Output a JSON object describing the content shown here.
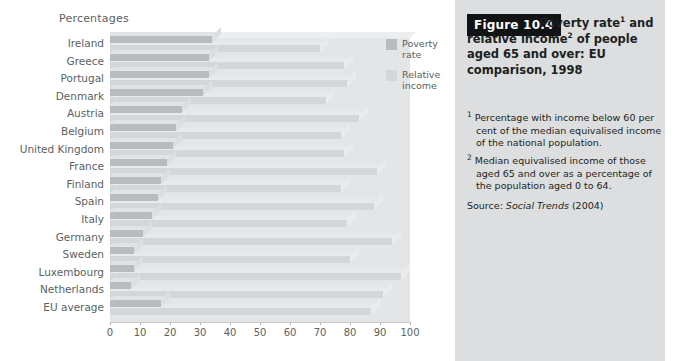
{
  "axis": {
    "y_axis_title": "Percentages",
    "ticks": [
      "0",
      "10",
      "20",
      "30",
      "40",
      "50",
      "60",
      "70",
      "80",
      "90",
      "100"
    ]
  },
  "legend": {
    "items": [
      {
        "label": "Poverty rate",
        "color": "#b9bcbf",
        "name": "poverty-rate"
      },
      {
        "label": "Relative income",
        "color": "#d4d7d9",
        "name": "relative-income"
      }
    ]
  },
  "caption": {
    "figure_tag": "Figure 10.4",
    "title": "Poverty rate¹ and relative income² of people aged 65 and over: EU comparison, 1998",
    "footnote_1": "¹ Percentage with income below 60 per cent of the median equivalised income of the national population.",
    "footnote_2": "² Median equivalised income of those aged 65 and over as a percentage of the population aged 0 to 64.",
    "source_prefix": "Source: ",
    "source_title": "Social Trends",
    "source_year": " (2004)"
  },
  "chart_data": {
    "type": "bar",
    "orientation": "horizontal",
    "xlabel": "Percentages",
    "ylabel": "",
    "xlim": [
      0,
      100
    ],
    "xticks": [
      0,
      10,
      20,
      30,
      40,
      50,
      60,
      70,
      80,
      90,
      100
    ],
    "grid": false,
    "legend_position": "right",
    "categories": [
      "Ireland",
      "Greece",
      "Portugal",
      "Denmark",
      "Austria",
      "Belgium",
      "United Kingdom",
      "France",
      "Finland",
      "Spain",
      "Italy",
      "Germany",
      "Sweden",
      "Luxembourg",
      "Netherlands",
      "EU average"
    ],
    "series": [
      {
        "name": "Poverty rate",
        "color": "#b9bcbf",
        "values": [
          34,
          33,
          33,
          31,
          24,
          22,
          21,
          19,
          17,
          16,
          14,
          11,
          8,
          8,
          7,
          17
        ]
      },
      {
        "name": "Relative income",
        "color": "#d4d7d9",
        "values": [
          70,
          78,
          79,
          72,
          83,
          77,
          78,
          89,
          77,
          88,
          79,
          94,
          80,
          97,
          91,
          87
        ]
      }
    ]
  }
}
